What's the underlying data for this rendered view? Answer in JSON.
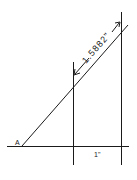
{
  "diagram": {
    "point_label": "A",
    "dimension_label": "1.5882\"",
    "base_label": "1\"",
    "colors": {
      "line": "#1a1a1a",
      "background": "#ffffff"
    }
  }
}
